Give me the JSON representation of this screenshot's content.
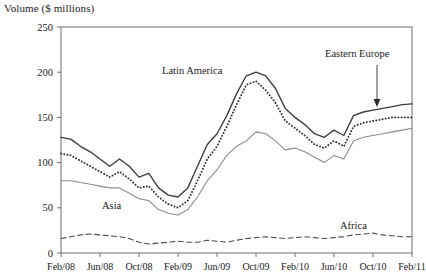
{
  "chart_data": {
    "type": "line",
    "title": "Volume ($ millions)",
    "xlabel": "",
    "ylabel": "Volume ($ millions)",
    "ylim": [
      0,
      250
    ],
    "yticks": [
      0,
      50,
      100,
      150,
      200,
      250
    ],
    "grid": false,
    "legend_position": "inline-annotations",
    "xtick_labels": [
      "Feb/08",
      "Jun/08",
      "Oct/08",
      "Feb/09",
      "Jun/09",
      "Oct/09",
      "Feb/10",
      "Jun/10",
      "Oct/10",
      "Feb/11"
    ],
    "x": [
      "Feb/08",
      "Mar/08",
      "Apr/08",
      "May/08",
      "Jun/08",
      "Jul/08",
      "Aug/08",
      "Sep/08",
      "Oct/08",
      "Nov/08",
      "Dec/08",
      "Jan/09",
      "Feb/09",
      "Mar/09",
      "Apr/09",
      "May/09",
      "Jun/09",
      "Jul/09",
      "Aug/09",
      "Sep/09",
      "Oct/09",
      "Nov/09",
      "Dec/09",
      "Jan/10",
      "Feb/10",
      "Mar/10",
      "Apr/10",
      "May/10",
      "Jun/10",
      "Jul/10",
      "Aug/10",
      "Sep/10",
      "Oct/10",
      "Nov/10",
      "Dec/10",
      "Jan/11",
      "Feb/11"
    ],
    "series": [
      {
        "name": "Eastern Europe",
        "style": "solid-dark",
        "color": "#3b3b3b",
        "values": [
          128,
          126,
          118,
          112,
          104,
          96,
          104,
          96,
          84,
          88,
          72,
          64,
          62,
          72,
          96,
          120,
          132,
          152,
          176,
          196,
          200,
          196,
          182,
          160,
          150,
          142,
          132,
          128,
          136,
          130,
          152,
          156,
          158,
          160,
          162,
          164,
          165
        ]
      },
      {
        "name": "Latin America",
        "style": "dotted",
        "color": "#2e2e2e",
        "values": [
          110,
          108,
          102,
          96,
          90,
          84,
          90,
          82,
          72,
          74,
          62,
          54,
          50,
          58,
          80,
          104,
          118,
          140,
          164,
          186,
          190,
          180,
          166,
          146,
          138,
          130,
          120,
          116,
          124,
          118,
          140,
          144,
          146,
          148,
          150,
          150,
          150
        ]
      },
      {
        "name": "Asia",
        "style": "solid-light",
        "color": "#8d8d8d",
        "values": [
          80,
          80,
          78,
          76,
          74,
          72,
          72,
          66,
          60,
          58,
          48,
          44,
          42,
          48,
          62,
          80,
          92,
          108,
          118,
          124,
          134,
          132,
          124,
          114,
          116,
          112,
          106,
          100,
          108,
          104,
          124,
          128,
          130,
          132,
          134,
          136,
          138
        ]
      },
      {
        "name": "Africa",
        "style": "dashed",
        "color": "#4a4a4a",
        "values": [
          16,
          18,
          20,
          21,
          20,
          19,
          18,
          16,
          12,
          10,
          11,
          12,
          13,
          12,
          12,
          14,
          13,
          12,
          14,
          16,
          17,
          18,
          17,
          16,
          17,
          18,
          17,
          16,
          17,
          18,
          20,
          21,
          22,
          20,
          19,
          18,
          18
        ]
      }
    ],
    "annotations": [
      {
        "label": "Latin America",
        "x_px": 162,
        "y_px": 74,
        "leader": false
      },
      {
        "label": "Eastern Europe",
        "x_px": 325,
        "y_px": 57,
        "leader": true
      },
      {
        "label": "Asia",
        "x_px": 102,
        "y_px": 209,
        "leader": false
      },
      {
        "label": "Africa",
        "x_px": 340,
        "y_px": 229,
        "leader": false
      }
    ]
  }
}
